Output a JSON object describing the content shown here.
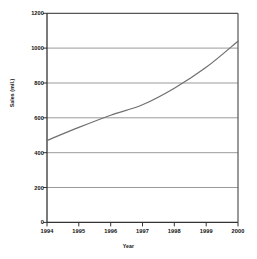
{
  "chart_data": {
    "type": "line",
    "title": "",
    "subtitle": "",
    "xlabel": "Year",
    "ylabel": "Sales (mil.)",
    "x": [
      1994,
      1995,
      1996,
      1997,
      1998,
      1999,
      2000
    ],
    "categories": [
      "1994",
      "1995",
      "1996",
      "1997",
      "1998",
      "1999",
      "2000"
    ],
    "values": [
      470,
      545,
      615,
      675,
      770,
      890,
      1040
    ],
    "series": [
      {
        "name": "Sales",
        "values": [
          470,
          545,
          615,
          675,
          770,
          890,
          1040
        ],
        "color": "#707070"
      }
    ],
    "xlim": [
      1994,
      2000
    ],
    "ylim": [
      0,
      1200
    ],
    "ytick_labels": [
      "0",
      "200",
      "400",
      "600",
      "800",
      "1000",
      "1200"
    ],
    "yticks": [
      0,
      200,
      400,
      600,
      800,
      1000,
      1200
    ],
    "xtick_labels": [
      "1994",
      "1995",
      "1996",
      "1997",
      "1998",
      "1999",
      "2000"
    ],
    "grid": "horizontal",
    "legend": "none",
    "gridline_color": "#9a9a9a",
    "axis_color": "#333333",
    "background_color": "#ffffff",
    "text_color": "#111111"
  }
}
